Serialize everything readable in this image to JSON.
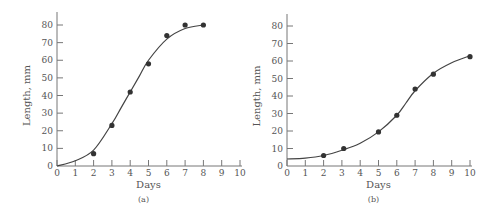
{
  "chart_data": [
    {
      "type": "scatter",
      "panel": "a",
      "caption": "(a)",
      "title": "",
      "xlabel": "Days",
      "ylabel": "Length, mm",
      "xlim": [
        0,
        10
      ],
      "ylim": [
        0,
        85
      ],
      "xticks": [
        0,
        1,
        2,
        3,
        4,
        5,
        6,
        7,
        8,
        9,
        10
      ],
      "yticks": [
        0,
        10,
        20,
        30,
        40,
        50,
        60,
        70,
        80
      ],
      "grid": false,
      "points": {
        "x": [
          2,
          3,
          4,
          5,
          6,
          7,
          8
        ],
        "y": [
          7,
          23,
          42,
          58,
          74,
          80,
          80
        ]
      },
      "fit_curve": {
        "x": [
          0,
          1,
          2,
          3,
          3.5,
          4,
          4.5,
          5,
          6,
          7,
          8
        ],
        "y": [
          0,
          3,
          9,
          24,
          33,
          42,
          51,
          60,
          72,
          78,
          80
        ]
      }
    },
    {
      "type": "scatter",
      "panel": "b",
      "caption": "(b)",
      "title": "",
      "xlabel": "Days",
      "ylabel": "Length, mm",
      "xlim": [
        0,
        10
      ],
      "ylim": [
        0,
        85
      ],
      "xticks": [
        0,
        1,
        2,
        3,
        4,
        5,
        6,
        7,
        8,
        9,
        10
      ],
      "yticks": [
        0,
        10,
        20,
        30,
        40,
        50,
        60,
        70,
        80
      ],
      "grid": false,
      "points": {
        "x": [
          2,
          3.1,
          5,
          6,
          7,
          8,
          10
        ],
        "y": [
          6,
          10,
          19.5,
          29,
          44,
          52.5,
          62.5
        ]
      },
      "fit_curve": {
        "x": [
          0,
          1,
          2,
          3,
          4,
          5,
          6,
          6.5,
          7,
          8,
          9,
          10
        ],
        "y": [
          4,
          4.5,
          6,
          9,
          13,
          19.5,
          29,
          36,
          43,
          53,
          59,
          63
        ]
      }
    }
  ]
}
